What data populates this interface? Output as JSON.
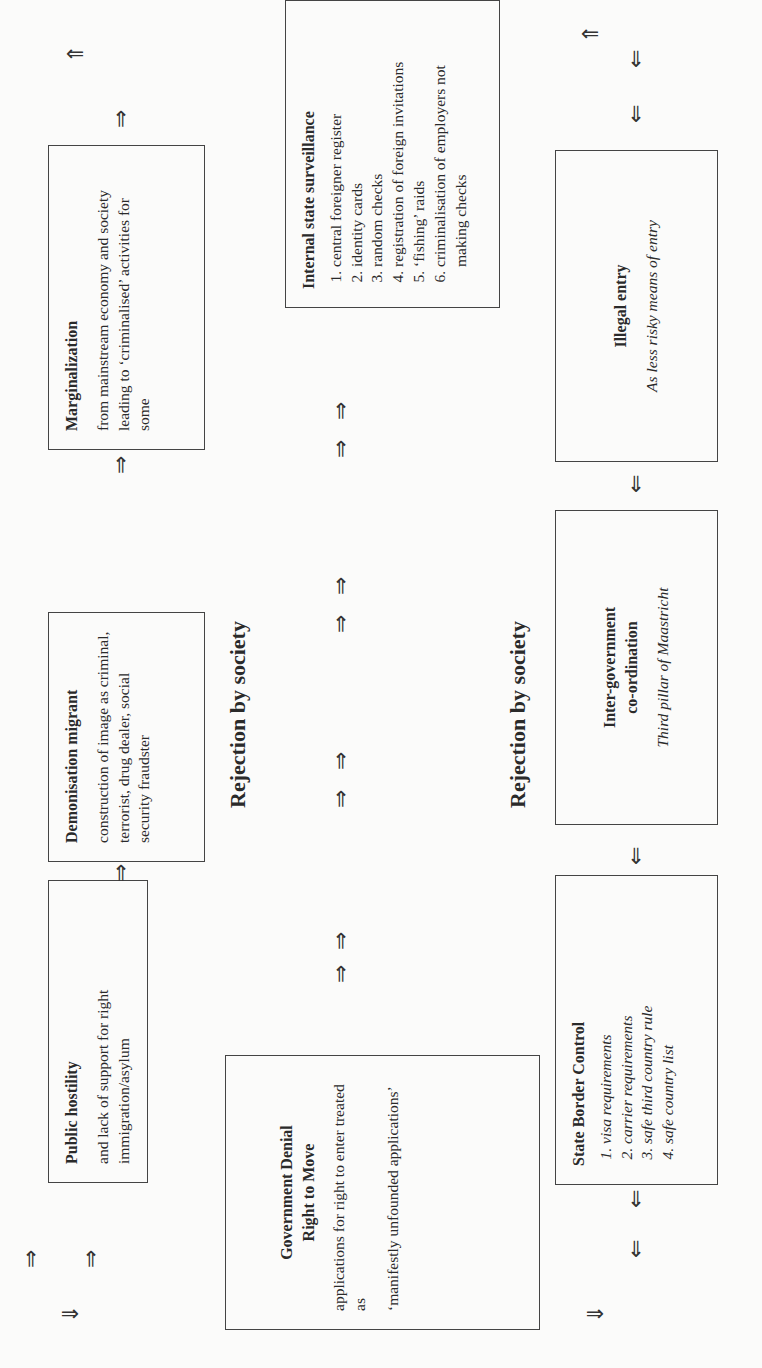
{
  "diagram": {
    "orientation": "rotated 90 degrees counter-clockwise",
    "boxes": {
      "public_hostility": {
        "title": "Public hostility",
        "body": "and lack of support for right immigration/asylum"
      },
      "demonisation": {
        "title": "Demonisation migrant",
        "body": "construction of image as criminal, terrorist, drug dealer, social security fraudster"
      },
      "marginalization": {
        "title": "Marginalization",
        "body": "from mainstream economy and society leading to ‘criminalised’ activities for some"
      },
      "government_denial": {
        "title_line1": "Government Denial",
        "title_line2": "Right to Move",
        "body1": "applications for right to enter treated as",
        "body2": "‘manifestly unfounded applications’"
      },
      "internal_surveillance": {
        "title": "Internal state surveillance",
        "items": [
          "central foreigner register",
          "identity cards",
          "random checks",
          "registration of foreign invitations",
          "‘fishing’ raids",
          "criminalisation of employers not making checks"
        ]
      },
      "state_border_control": {
        "title": "State Border Control",
        "items": [
          "visa requirements",
          "carrier requirements",
          "safe third country rule",
          "safe country list"
        ]
      },
      "inter_government": {
        "title_line1": "Inter-government",
        "title_line2": "co-ordination",
        "body": "Third pillar of Maastricht"
      },
      "illegal_entry": {
        "title": "Illegal entry",
        "body": "As less risky means of entry"
      }
    },
    "labels": {
      "rejection_1": "Rejection by society",
      "rejection_2": "Rejection by society"
    },
    "arrows": {
      "right": "⇒",
      "left": "⇐",
      "up": "⇑",
      "down": "⇓"
    }
  }
}
